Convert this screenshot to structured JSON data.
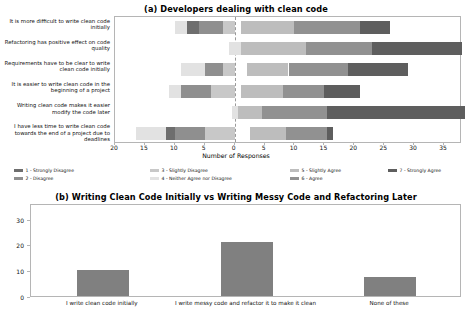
{
  "figure": {
    "background": "#ffffff"
  },
  "panel_a": {
    "title": "(a) Developers dealing with clean code",
    "xlabel": "Number of Responses",
    "legend": [
      {
        "label": "1 - Strongly Disagree",
        "color": "#6e6e6e"
      },
      {
        "label": "2 - Disagree",
        "color": "#8f8f8f"
      },
      {
        "label": "3 - Slightly Disagree",
        "color": "#c8c8c8"
      },
      {
        "label": "4 - Neither Agree nor Disagree",
        "color": "#e2e2e2"
      },
      {
        "label": "5 - Slightly Agree",
        "color": "#bdbdbd"
      },
      {
        "label": "6 - Agree",
        "color": "#919191"
      },
      {
        "label": "7 - Strongly Agree",
        "color": "#5e5e5e"
      }
    ]
  },
  "panel_b": {
    "title": "(b) Writing Clean Code Initially vs Writing Messy Code and Refactoring Later"
  },
  "chart_data": [
    {
      "type": "bar",
      "subtype": "diverging-stacked-likert",
      "title": "(a) Developers dealing with clean code",
      "xlabel": "Number of Responses",
      "ylabel": "",
      "orientation": "horizontal",
      "grid": false,
      "legend_position": "below",
      "xlim": [
        -20,
        38
      ],
      "xticks": [
        -20,
        -15,
        -10,
        -5,
        0,
        5,
        10,
        15,
        20,
        25,
        30,
        35
      ],
      "xticklabels": [
        "20",
        "15",
        "10",
        "5",
        "0",
        "5",
        "10",
        "15",
        "20",
        "25",
        "30",
        "35"
      ],
      "zero_reference_line": 0,
      "categories": [
        "It is more difficult to write clean code initially",
        "Refactoring has positive effect on code quality",
        "Requirements have to be clear to write clean code initially",
        "It is easier to write clean code in the beginning of a project",
        "Writing clean code makes it easier modify the code later",
        "I have less time to write clean code towards the end of a project due to deadlines"
      ],
      "series": [
        {
          "name": "1 - Strongly Disagree",
          "color": "#6e6e6e",
          "values": [
            3,
            0,
            1,
            1,
            0,
            4
          ]
        },
        {
          "name": "2 - Disagree",
          "color": "#8f8f8f",
          "values": [
            4,
            0,
            4,
            5,
            0,
            5
          ]
        },
        {
          "name": "3 - Slightly Disagree",
          "color": "#c8c8c8",
          "values": [
            2,
            0,
            2,
            4,
            0,
            5
          ]
        },
        {
          "name": "4 - Neither Agree nor Disagree",
          "color": "#e2e2e2",
          "values": [
            2,
            2,
            4,
            2,
            1,
            5
          ]
        },
        {
          "name": "5 - Slightly Agree",
          "color": "#bdbdbd",
          "values": [
            9,
            11,
            7,
            7,
            4,
            6
          ]
        },
        {
          "name": "6 - Agree",
          "color": "#919191",
          "values": [
            11,
            11,
            10,
            7,
            11,
            7
          ]
        },
        {
          "name": "7 - Strongly Agree",
          "color": "#5e5e5e",
          "values": [
            5,
            15,
            10,
            6,
            23,
            1
          ]
        }
      ]
    },
    {
      "type": "bar",
      "title": "(b) Writing Clean Code Initially vs Writing Messy Code and Refactoring Later",
      "xlabel": "",
      "ylabel": "",
      "grid": false,
      "bar_color": "#808080",
      "ylim": [
        0,
        36
      ],
      "yticks": [
        0,
        10,
        20,
        30
      ],
      "categories": [
        "I write clean code initially",
        "I write messy code and refactor it to make it clean",
        "None of these"
      ],
      "values": [
        10,
        21,
        7.5
      ]
    }
  ]
}
